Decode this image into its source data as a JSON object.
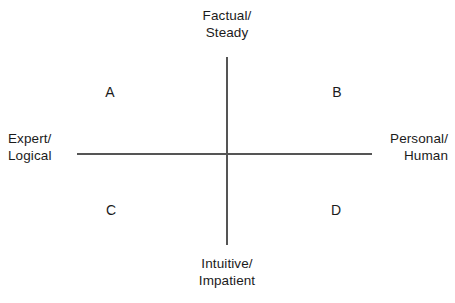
{
  "diagram": {
    "type": "two-axis-quadrant-matrix",
    "background_color": "#ffffff",
    "line_color": "#555555",
    "text_color": "#1b1b1b",
    "axes": {
      "vertical": {
        "top_label": "Factual/\nSteady",
        "bottom_label": "Intuitive/\nImpatient"
      },
      "horizontal": {
        "left_label": "Expert/\nLogical",
        "right_label": "Personal/\nHuman"
      }
    },
    "quadrants": [
      {
        "id": "a",
        "label": "A",
        "position": "top-left"
      },
      {
        "id": "b",
        "label": "B",
        "position": "top-right"
      },
      {
        "id": "c",
        "label": "C",
        "position": "bottom-left"
      },
      {
        "id": "d",
        "label": "D",
        "position": "bottom-right"
      }
    ]
  },
  "chart_data": {
    "type": "scatter",
    "title": "",
    "xlabel": "Expert/Logical ↔ Personal/Human",
    "ylabel": "Intuitive/Impatient ↔ Factual/Steady",
    "x_axis_left_label": "Expert/\nLogical",
    "x_axis_right_label": "Personal/\nHuman",
    "y_axis_top_label": "Factual/\nSteady",
    "y_axis_bottom_label": "Intuitive/\nImpatient",
    "grid": false,
    "legend": "none",
    "quadrant_labels": [
      "A",
      "B",
      "C",
      "D"
    ],
    "quadrant_positions": [
      "top-left",
      "top-right",
      "bottom-left",
      "bottom-right"
    ]
  }
}
